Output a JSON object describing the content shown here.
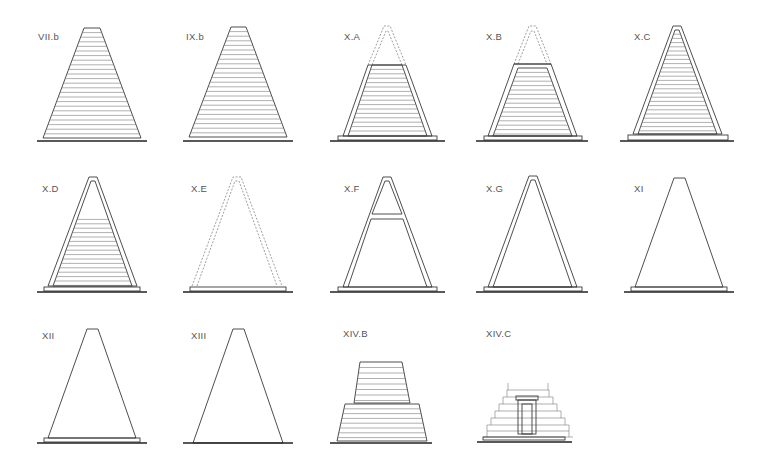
{
  "diagram": {
    "title": "",
    "type": "pyramid construction types",
    "colors": {
      "line": "#3a3a3a",
      "course": "#7a7a7a",
      "ground": "#222222",
      "label": "#555555"
    },
    "figures": [
      {
        "id": "VII.b",
        "label": "VII.b",
        "style": "solid-courses"
      },
      {
        "id": "IX.b",
        "label": "IX.b",
        "style": "solid-courses"
      },
      {
        "id": "X.A",
        "label": "X.A",
        "style": "casing-courses-truncated-dashed-top"
      },
      {
        "id": "X.B",
        "label": "X.B",
        "style": "casing-courses-truncated-dashed-top"
      },
      {
        "id": "X.C",
        "label": "X.C",
        "style": "casing-full-courses"
      },
      {
        "id": "X.D",
        "label": "X.D",
        "style": "casing-partial-courses"
      },
      {
        "id": "X.E",
        "label": "X.E",
        "style": "dashed-casing-empty"
      },
      {
        "id": "X.F",
        "label": "X.F",
        "style": "casing-with-crossbar"
      },
      {
        "id": "X.G",
        "label": "X.G",
        "style": "casing-empty"
      },
      {
        "id": "XI",
        "label": "XI",
        "style": "outline-with-plinth"
      },
      {
        "id": "XII",
        "label": "XII",
        "style": "outline-with-plinth"
      },
      {
        "id": "XIII",
        "label": "XIII",
        "style": "outline-no-plinth"
      },
      {
        "id": "XIV.B",
        "label": "XIV.B",
        "style": "stepped-two-stage"
      },
      {
        "id": "XIV.C",
        "label": "XIV.C",
        "style": "stepped-with-chapel-door"
      }
    ]
  }
}
